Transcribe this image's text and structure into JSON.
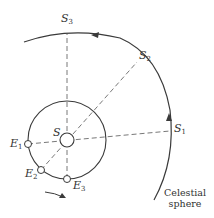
{
  "diagram": {
    "labels": {
      "sun": "S",
      "earth_positions": [
        {
          "name": "E",
          "sub": "1"
        },
        {
          "name": "E",
          "sub": "2"
        },
        {
          "name": "E",
          "sub": "3"
        }
      ],
      "sky_positions": [
        {
          "name": "S",
          "sub": "1"
        },
        {
          "name": "S",
          "sub": "2"
        },
        {
          "name": "S",
          "sub": "3"
        }
      ],
      "celestial_line1": "Celestial",
      "celestial_line2": "sphere"
    },
    "colors": {
      "stroke": "#3a3a3a",
      "background": "#ffffff"
    }
  }
}
